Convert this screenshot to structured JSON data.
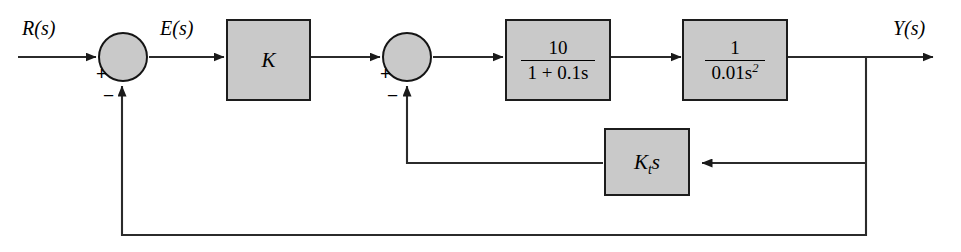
{
  "diagram": {
    "type": "control-system-block-diagram",
    "canvas": {
      "width": 961,
      "height": 252
    },
    "colors": {
      "block_fill": "#c9c9c9",
      "block_stroke": "#1c1c1c",
      "wire": "#2b2b2b",
      "background": "#ffffff"
    },
    "signals": {
      "input_label": "R(s)",
      "error_label": "E(s)",
      "output_label": "Y(s)"
    },
    "blocks": [
      {
        "id": "gain-k",
        "label": "K",
        "kind": "gain"
      },
      {
        "id": "first-order-lag",
        "numerator": "10",
        "denominator": "1 + 0.1s",
        "kind": "transfer-function"
      },
      {
        "id": "double-integrator",
        "numerator": "1",
        "denominator": "0.01s",
        "denominator_exponent": "2",
        "kind": "transfer-function"
      },
      {
        "id": "rate-feedback",
        "label": "K",
        "label_subscript": "t",
        "label_suffix": "s",
        "kind": "tachometer-gain"
      }
    ],
    "summing_junctions": [
      {
        "id": "outer-sum",
        "plus_sign": "+",
        "minus_sign": "−"
      },
      {
        "id": "inner-sum",
        "plus_sign": "+",
        "minus_sign": "−"
      }
    ]
  }
}
